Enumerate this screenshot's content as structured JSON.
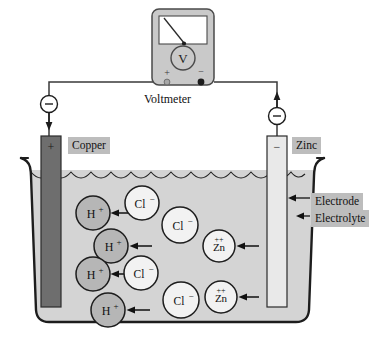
{
  "diagram": {
    "meter": {
      "dial_symbol": "V",
      "terminal_positive": "+",
      "terminal_negative": "−",
      "caption": "Voltmeter"
    },
    "electrodes": [
      {
        "name": "copper-electrode",
        "label": "Copper",
        "polarity": "+",
        "fill": "#6e6e6e"
      },
      {
        "name": "zinc-electrode",
        "label": "Zinc",
        "polarity": "−",
        "fill": "#e9e9e9"
      }
    ],
    "electron_markers": [
      {
        "name": "electron-left",
        "symbol": "−",
        "direction": "down"
      },
      {
        "name": "electron-right",
        "symbol": "−",
        "direction": "up"
      }
    ],
    "annotations": [
      {
        "name": "electrode-callout",
        "label": "Electrode"
      },
      {
        "name": "electrolyte-callout",
        "label": "Electrolyte"
      }
    ],
    "ions": [
      {
        "name": "ion-h-1",
        "species": "H",
        "charge": "+",
        "x": 93,
        "y": 213,
        "r": 17,
        "fill": "#b6b6b6",
        "arrow": true
      },
      {
        "name": "ion-h-2",
        "species": "H",
        "charge": "+",
        "x": 111,
        "y": 246,
        "r": 17,
        "fill": "#b6b6b6",
        "arrow": true
      },
      {
        "name": "ion-h-3",
        "species": "H",
        "charge": "+",
        "x": 93,
        "y": 274,
        "r": 17,
        "fill": "#b6b6b6",
        "arrow": true
      },
      {
        "name": "ion-h-4",
        "species": "H",
        "charge": "+",
        "x": 108,
        "y": 310,
        "r": 17,
        "fill": "#b6b6b6",
        "arrow": true
      },
      {
        "name": "ion-cl-1",
        "species": "Cl",
        "charge": "−",
        "x": 142,
        "y": 203,
        "r": 17,
        "fill": "#f2f2f2",
        "arrow": false
      },
      {
        "name": "ion-cl-2",
        "species": "Cl",
        "charge": "−",
        "x": 180,
        "y": 225,
        "r": 18,
        "fill": "#f2f2f2",
        "arrow": false
      },
      {
        "name": "ion-cl-3",
        "species": "Cl",
        "charge": "−",
        "x": 141,
        "y": 273,
        "r": 17,
        "fill": "#f2f2f2",
        "arrow": false
      },
      {
        "name": "ion-cl-4",
        "species": "Cl",
        "charge": "−",
        "x": 181,
        "y": 300,
        "r": 18,
        "fill": "#f2f2f2",
        "arrow": false
      },
      {
        "name": "ion-zn-1",
        "species": "Zn",
        "charge": "++",
        "x": 219,
        "y": 246,
        "r": 16,
        "fill": "#f2f2f2",
        "arrow": true
      },
      {
        "name": "ion-zn-2",
        "species": "Zn",
        "charge": "++",
        "x": 221,
        "y": 297,
        "r": 16,
        "fill": "#f2f2f2",
        "arrow": true
      }
    ],
    "colors": {
      "electrolyte": "#d4d4d4",
      "beaker_outline": "#222222",
      "wire": "#3a3a3a",
      "meter_body": "#c9c9c9",
      "label_bg": "#bdbdbd"
    }
  }
}
